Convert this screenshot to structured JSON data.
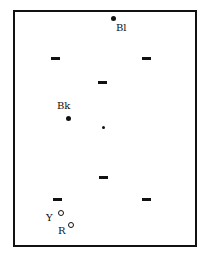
{
  "diagram": {
    "type": "snooker-table-layout",
    "labels": {
      "blue": "Bl",
      "black": "Bk",
      "yellow": "Y",
      "red": "R"
    },
    "balls": [
      {
        "name": "blue",
        "label": "Bl",
        "x": 114,
        "y": 19,
        "style": "filled"
      },
      {
        "name": "black",
        "label": "Bk",
        "x": 68,
        "y": 118,
        "style": "filled"
      },
      {
        "name": "center-spot",
        "label": "",
        "x": 103,
        "y": 127,
        "style": "small-filled"
      },
      {
        "name": "yellow",
        "label": "Y",
        "x": 61,
        "y": 213,
        "style": "open"
      },
      {
        "name": "red",
        "label": "R",
        "x": 71,
        "y": 225,
        "style": "open"
      }
    ],
    "markers": [
      {
        "x": 55,
        "y": 58
      },
      {
        "x": 147,
        "y": 58
      },
      {
        "x": 102,
        "y": 82
      },
      {
        "x": 103,
        "y": 177
      },
      {
        "x": 57,
        "y": 199
      },
      {
        "x": 147,
        "y": 199
      }
    ]
  }
}
